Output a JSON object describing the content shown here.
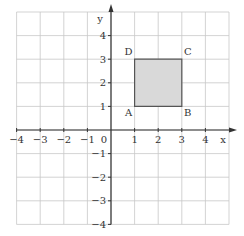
{
  "diagram": {
    "type": "coordinate-grid",
    "x_axis": {
      "label": "x",
      "min": -4,
      "max": 5,
      "ticks": [
        {
          "value": -4,
          "label": "−4"
        },
        {
          "value": -3,
          "label": "−3"
        },
        {
          "value": -2,
          "label": "−2"
        },
        {
          "value": -1,
          "label": "−1"
        },
        {
          "value": 1,
          "label": "1"
        },
        {
          "value": 2,
          "label": "2"
        },
        {
          "value": 3,
          "label": "3"
        },
        {
          "value": 4,
          "label": "4"
        }
      ]
    },
    "y_axis": {
      "label": "y",
      "min": -4,
      "max": 5,
      "ticks": [
        {
          "value": 4,
          "label": "4"
        },
        {
          "value": 3,
          "label": "3"
        },
        {
          "value": 2,
          "label": "2"
        },
        {
          "value": 1,
          "label": "1"
        },
        {
          "value": -1,
          "label": "−1"
        },
        {
          "value": -2,
          "label": "−2"
        },
        {
          "value": -3,
          "label": "−3"
        },
        {
          "value": -4,
          "label": "−4"
        }
      ]
    },
    "origin_label": "0",
    "shape": {
      "fill": "#d9d9d9",
      "stroke": "#555555",
      "vertices": [
        {
          "name": "A",
          "x": 1,
          "y": 1
        },
        {
          "name": "B",
          "x": 3,
          "y": 1
        },
        {
          "name": "C",
          "x": 3,
          "y": 3
        },
        {
          "name": "D",
          "x": 1,
          "y": 3
        }
      ]
    },
    "colors": {
      "grid": "#c8c8c8",
      "axis": "#333333"
    }
  }
}
